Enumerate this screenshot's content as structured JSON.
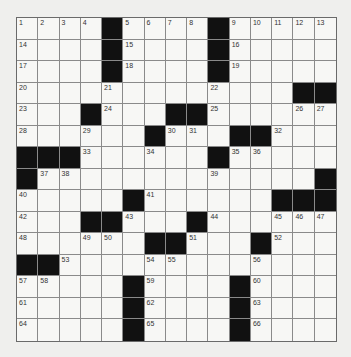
{
  "puzzle": {
    "rows": 15,
    "cols": 15,
    "colors": {
      "block": "#111111",
      "cell": "#f7f7f5",
      "line": "#8a8a8a",
      "background": "#efefed"
    },
    "grid": [
      [
        "1",
        "2",
        "3",
        "4",
        "#",
        "5",
        "6",
        "7",
        "8",
        "#",
        "9",
        "10",
        "11",
        "12",
        "13"
      ],
      [
        "14",
        ".",
        ".",
        ".",
        "#",
        "15",
        ".",
        ".",
        ".",
        "#",
        "16",
        ".",
        ".",
        ".",
        "."
      ],
      [
        "17",
        ".",
        ".",
        ".",
        "#",
        "18",
        ".",
        ".",
        ".",
        "#",
        "19",
        ".",
        ".",
        ".",
        "."
      ],
      [
        "20",
        ".",
        ".",
        ".",
        "21",
        ".",
        ".",
        ".",
        ".",
        "22",
        ".",
        ".",
        ".",
        "#",
        "#"
      ],
      [
        "23",
        ".",
        ".",
        "#",
        "24",
        ".",
        ".",
        "#",
        "#",
        "25",
        ".",
        ".",
        ".",
        "26",
        "27"
      ],
      [
        "28",
        ".",
        ".",
        "29",
        ".",
        ".",
        "#",
        "30",
        "31",
        ".",
        "#",
        "#",
        "32",
        ".",
        "."
      ],
      [
        "#",
        "#",
        "#",
        "33",
        ".",
        ".",
        "34",
        ".",
        ".",
        "#",
        "35",
        "36",
        ".",
        ".",
        "."
      ],
      [
        "#",
        "37",
        "38",
        ".",
        ".",
        ".",
        ".",
        ".",
        ".",
        "39",
        ".",
        ".",
        ".",
        ".",
        "#"
      ],
      [
        "40",
        ".",
        ".",
        ".",
        ".",
        "#",
        "41",
        ".",
        ".",
        ".",
        ".",
        ".",
        "#",
        "#",
        "#"
      ],
      [
        "42",
        ".",
        ".",
        "#",
        "#",
        "43",
        ".",
        ".",
        "#",
        "44",
        ".",
        ".",
        "45",
        "46",
        "47"
      ],
      [
        "48",
        ".",
        ".",
        "49",
        "50",
        ".",
        "#",
        "#",
        "51",
        ".",
        ".",
        "#",
        "52",
        ".",
        "."
      ],
      [
        "#",
        "#",
        "53",
        ".",
        ".",
        ".",
        "54",
        "55",
        ".",
        ".",
        ".",
        "56",
        ".",
        ".",
        "."
      ],
      [
        "57",
        "58",
        ".",
        ".",
        ".",
        "#",
        "59",
        ".",
        ".",
        ".",
        "#",
        "60",
        ".",
        ".",
        "."
      ],
      [
        "61",
        ".",
        ".",
        ".",
        ".",
        "#",
        "62",
        ".",
        ".",
        ".",
        "#",
        "63",
        ".",
        ".",
        "."
      ],
      [
        "64",
        ".",
        ".",
        ".",
        ".",
        "#",
        "65",
        ".",
        ".",
        ".",
        "#",
        "66",
        ".",
        ".",
        "."
      ]
    ]
  }
}
